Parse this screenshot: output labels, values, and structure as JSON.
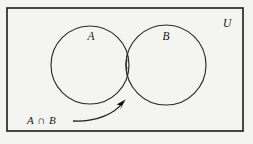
{
  "diagram": {
    "type": "venn-diagram",
    "universe": {
      "label": "U",
      "name": "universal-set"
    },
    "sets": [
      {
        "id": "A",
        "label": "A",
        "name": "set-a"
      },
      {
        "id": "B",
        "label": "B",
        "name": "set-b"
      }
    ],
    "region": {
      "label": "A ∩ B",
      "name": "intersection-region",
      "fill": "diagonal-hatch",
      "shaded": true
    },
    "colors": {
      "background": "#f4f4f2",
      "stroke": "#2a2a2a",
      "frame": "#1c1c1c",
      "text": "#1a1a1a",
      "hatch": "#2e2e2e",
      "arrow": "#111111"
    },
    "geometry": {
      "frame": {
        "x": 7,
        "y": 8,
        "width": 236,
        "height": 123
      },
      "circle_a": {
        "cx": 90,
        "cy": 65,
        "r": 39
      },
      "circle_b": {
        "cx": 166,
        "cy": 65,
        "r": 40
      },
      "label_a": {
        "x": 91,
        "y": 40
      },
      "label_b": {
        "x": 165,
        "y": 40
      },
      "label_u": {
        "x": 223,
        "y": 27
      },
      "callout_text": {
        "x": 27,
        "y": 124
      },
      "arrow_tip": {
        "x": 124,
        "y": 101
      }
    }
  }
}
